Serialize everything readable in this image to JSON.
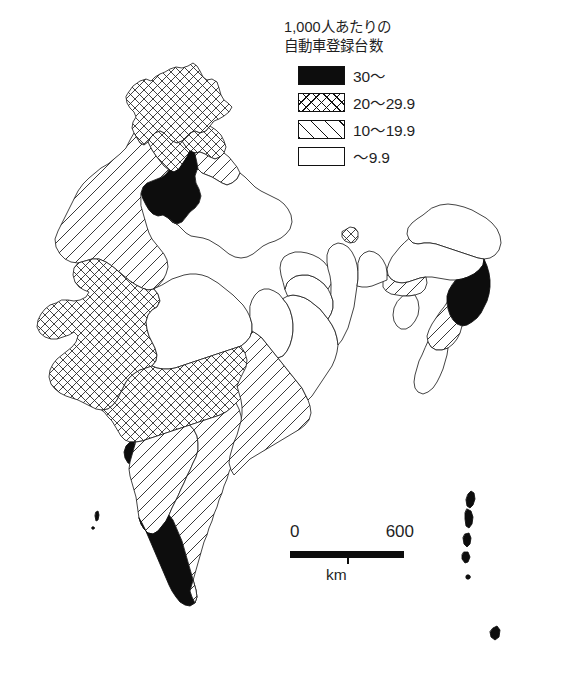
{
  "legend": {
    "title": "1,000人あたりの\n自動車登録台数",
    "title_lines": [
      "1,000人あたりの",
      "自動車登録台数"
    ],
    "entries": [
      {
        "label": "30〜",
        "pattern": "solid",
        "swatch_name": "legend-swatch-solid"
      },
      {
        "label": "20〜29.9",
        "pattern": "crosshatch",
        "swatch_name": "legend-swatch-crosshatch"
      },
      {
        "label": "10〜19.9",
        "pattern": "diagonal",
        "swatch_name": "legend-swatch-diagonal"
      },
      {
        "label": "〜9.9",
        "pattern": "blank",
        "swatch_name": "legend-swatch-blank"
      }
    ]
  },
  "scalebar": {
    "min_label": "0",
    "max_label": "600",
    "unit_label": "km"
  },
  "map": {
    "title": "India — registered motor vehicles per 1,000 people",
    "ink_color": "#111111",
    "fill_solid": "#0d0d0d",
    "regions": [
      {
        "name": "jammu-kashmir",
        "class": "30〜",
        "pattern": "crosshatch"
      },
      {
        "name": "himachal-pradesh",
        "class": "20〜29.9",
        "pattern": "crosshatch"
      },
      {
        "name": "punjab",
        "class": "20〜29.9",
        "pattern": "crosshatch"
      },
      {
        "name": "haryana-delhi",
        "class": "30〜",
        "pattern": "solid"
      },
      {
        "name": "uttarakhand",
        "class": "10〜19.9",
        "pattern": "diagonal"
      },
      {
        "name": "rajasthan",
        "class": "10〜19.9",
        "pattern": "diagonal"
      },
      {
        "name": "uttar-pradesh",
        "class": "〜9.9",
        "pattern": "blank"
      },
      {
        "name": "gujarat",
        "class": "20〜29.9",
        "pattern": "crosshatch"
      },
      {
        "name": "madhya-pradesh",
        "class": "〜9.9",
        "pattern": "blank"
      },
      {
        "name": "maharashtra",
        "class": "20〜29.9",
        "pattern": "crosshatch"
      },
      {
        "name": "goa",
        "class": "30〜",
        "pattern": "solid"
      },
      {
        "name": "karnataka",
        "class": "10〜19.9",
        "pattern": "diagonal"
      },
      {
        "name": "kerala",
        "class": "30〜",
        "pattern": "solid"
      },
      {
        "name": "tamil-nadu",
        "class": "10〜19.9",
        "pattern": "diagonal"
      },
      {
        "name": "andhra-pradesh",
        "class": "10〜19.9",
        "pattern": "diagonal"
      },
      {
        "name": "chhattisgarh",
        "class": "〜9.9",
        "pattern": "blank"
      },
      {
        "name": "odisha",
        "class": "〜9.9",
        "pattern": "blank"
      },
      {
        "name": "bihar",
        "class": "〜9.9",
        "pattern": "blank"
      },
      {
        "name": "jharkhand",
        "class": "〜9.9",
        "pattern": "blank"
      },
      {
        "name": "west-bengal",
        "class": "〜9.9",
        "pattern": "blank"
      },
      {
        "name": "sikkim",
        "class": "20〜29.9",
        "pattern": "crosshatch"
      },
      {
        "name": "assam",
        "class": "〜9.9",
        "pattern": "blank"
      },
      {
        "name": "arunachal-pradesh",
        "class": "〜9.9",
        "pattern": "blank"
      },
      {
        "name": "meghalaya",
        "class": "10〜19.9",
        "pattern": "diagonal"
      },
      {
        "name": "nagaland",
        "class": "30〜",
        "pattern": "solid"
      },
      {
        "name": "manipur",
        "class": "10〜19.9",
        "pattern": "diagonal"
      },
      {
        "name": "mizoram",
        "class": "〜9.9",
        "pattern": "blank"
      },
      {
        "name": "tripura",
        "class": "〜9.9",
        "pattern": "blank"
      },
      {
        "name": "andaman-nicobar-islands",
        "class": "30〜",
        "pattern": "solid"
      },
      {
        "name": "lakshadweep",
        "class": "30〜",
        "pattern": "solid"
      }
    ]
  }
}
